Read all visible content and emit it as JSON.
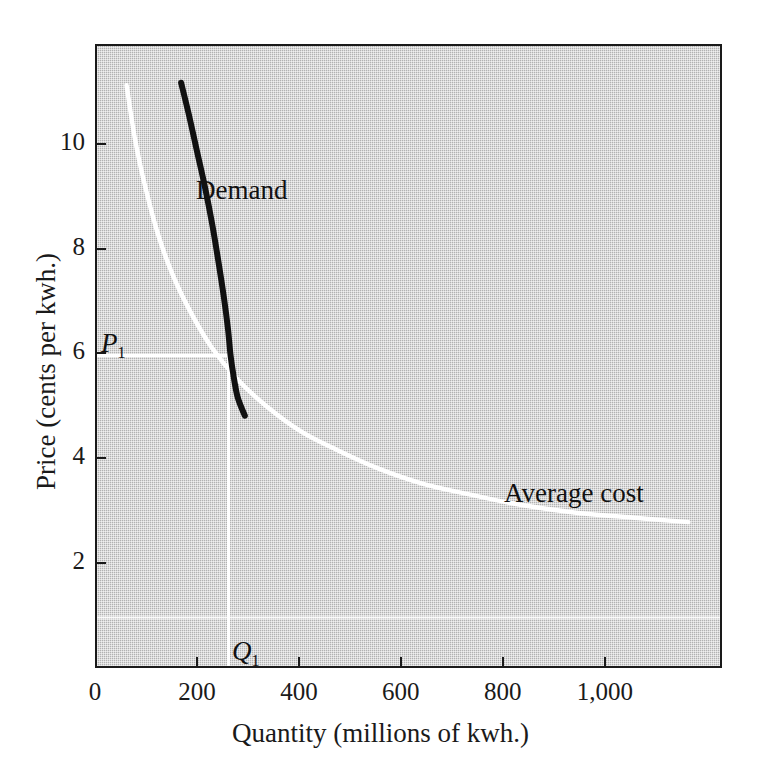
{
  "chart_data": {
    "type": "line",
    "title": "",
    "xlabel": "Quantity (millions of kwh.)",
    "ylabel": "Price (cents per kwh.)",
    "xlim": [
      0,
      1230
    ],
    "ylim": [
      0,
      11.9
    ],
    "grid": false,
    "legend_position": "inline-annotations",
    "xticks": [
      0,
      200,
      400,
      600,
      800,
      1000
    ],
    "xtick_labels": [
      "0",
      "200",
      "400",
      "600",
      "800",
      "1,000"
    ],
    "yticks": [
      2,
      4,
      6,
      8,
      10
    ],
    "ytick_labels": [
      "2",
      "4",
      "6",
      "8",
      "10"
    ],
    "series": [
      {
        "name": "Demand",
        "color": "#111111",
        "label_text": "Demand",
        "points": [
          [
            165,
            11.2
          ],
          [
            180,
            10.6
          ],
          [
            196,
            9.9
          ],
          [
            212,
            9.2
          ],
          [
            226,
            8.5
          ],
          [
            238,
            7.8
          ],
          [
            249,
            7.1
          ],
          [
            257,
            6.5
          ],
          [
            262,
            6.0
          ],
          [
            268,
            5.6
          ],
          [
            276,
            5.2
          ],
          [
            290,
            4.85
          ]
        ]
      },
      {
        "name": "Average cost",
        "color": "#ffffff",
        "label_text": "Average cost",
        "points": [
          [
            58,
            11.15
          ],
          [
            75,
            10.1
          ],
          [
            95,
            9.2
          ],
          [
            120,
            8.3
          ],
          [
            150,
            7.5
          ],
          [
            185,
            6.8
          ],
          [
            225,
            6.15
          ],
          [
            275,
            5.55
          ],
          [
            330,
            5.05
          ],
          [
            400,
            4.55
          ],
          [
            470,
            4.2
          ],
          [
            550,
            3.85
          ],
          [
            640,
            3.55
          ],
          [
            730,
            3.35
          ],
          [
            830,
            3.15
          ],
          [
            940,
            3.0
          ],
          [
            1060,
            2.9
          ],
          [
            1160,
            2.82
          ]
        ]
      }
    ],
    "annotations": [
      {
        "name": "equilibrium-price-line",
        "type": "hline",
        "value": 6.0,
        "from_x": 0,
        "to_x": 258,
        "color": "#ffffff",
        "label": "P",
        "label_subscript": "1"
      },
      {
        "name": "equilibrium-quantity-line",
        "type": "vline",
        "value": 258,
        "from_y": 0,
        "to_y": 6.0,
        "color": "#ffffff",
        "label": "Q",
        "label_subscript": "1"
      },
      {
        "name": "average-cost-asymptote",
        "type": "hline",
        "value": 1.0,
        "from_x": 0,
        "to_x": 1230,
        "color": "#ffffff",
        "label": "",
        "label_subscript": ""
      }
    ]
  },
  "figure": {
    "plot_background_color": "#bdbdbd",
    "frame_color": "#1a1a1a",
    "page_background_color": "#ffffff"
  },
  "labels": {
    "demand": "Demand",
    "average_cost": "Average cost",
    "p1_base": "P",
    "p1_sub": "1",
    "q1_base": "Q",
    "q1_sub": "1",
    "x_title": "Quantity (millions of kwh.)",
    "y_title": "Price (cents per kwh.)"
  }
}
